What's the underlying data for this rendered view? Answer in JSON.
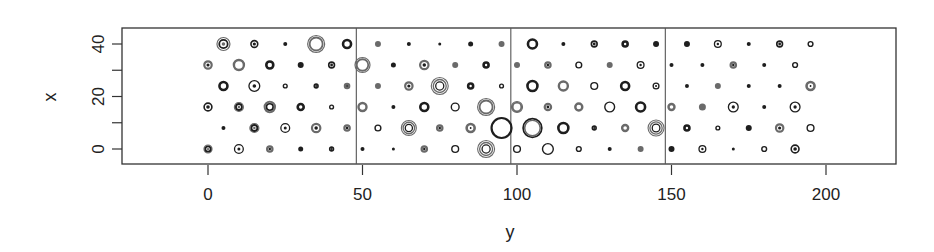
{
  "chart_data": {
    "type": "scatter",
    "title": "",
    "xlabel": "y",
    "ylabel": "x",
    "xlim": [
      -28,
      224
    ],
    "ylim": [
      -6,
      46
    ],
    "x_ticks": [
      0,
      50,
      100,
      150,
      200
    ],
    "x_tick_labels": [
      "0",
      "50",
      "100",
      "150",
      "200"
    ],
    "y_ticks": [
      0,
      10,
      20,
      30,
      40
    ],
    "y_tick_labels": [
      "0",
      "",
      "20",
      "",
      "40"
    ],
    "grid": false,
    "legend": null,
    "panel_dividers_at_y": [
      48,
      98,
      148
    ],
    "note": "Bubble/glyph scatter: points on a staggered grid; each marker is a set of concentric rings whose size varies. Values: [y, x, radius_px, style]",
    "points": [
      [
        5,
        40,
        7,
        "double"
      ],
      [
        15,
        40,
        4,
        "dot-ring"
      ],
      [
        25,
        40,
        2,
        "dot"
      ],
      [
        35,
        40,
        9,
        "double-thin"
      ],
      [
        45,
        40,
        5,
        "ring-thick"
      ],
      [
        55,
        40,
        3,
        "dot-grey"
      ],
      [
        65,
        40,
        2,
        "dot"
      ],
      [
        75,
        40,
        1.5,
        "dot"
      ],
      [
        85,
        40,
        2.5,
        "dot"
      ],
      [
        95,
        40,
        3,
        "dot-grey"
      ],
      [
        105,
        40,
        5.5,
        "ring-thick"
      ],
      [
        115,
        40,
        2,
        "dot"
      ],
      [
        125,
        40,
        3.5,
        "dot-ring"
      ],
      [
        135,
        40,
        3.5,
        "ring-thick"
      ],
      [
        145,
        40,
        3,
        "dot"
      ],
      [
        155,
        40,
        3,
        "dot"
      ],
      [
        165,
        40,
        4,
        "ring-dot"
      ],
      [
        175,
        40,
        2,
        "dot"
      ],
      [
        185,
        40,
        3.5,
        "dot-ring"
      ],
      [
        195,
        40,
        3,
        "ring"
      ],
      [
        0,
        32,
        4.5,
        "dot-ring-grey"
      ],
      [
        10,
        32,
        6,
        "ring-grey"
      ],
      [
        20,
        32,
        4.5,
        "ring-thick"
      ],
      [
        30,
        32,
        3,
        "dot"
      ],
      [
        40,
        32,
        3.5,
        "dot-ring"
      ],
      [
        50,
        32,
        8,
        "double-thin"
      ],
      [
        60,
        32,
        2.5,
        "dot"
      ],
      [
        70,
        32,
        5,
        "dot-ring-grey"
      ],
      [
        80,
        32,
        3,
        "dot-grey"
      ],
      [
        90,
        32,
        3.5,
        "ring-thick"
      ],
      [
        100,
        32,
        3,
        "dot-grey"
      ],
      [
        110,
        32,
        3.5,
        "dot-ring-grey"
      ],
      [
        120,
        32,
        3.5,
        "ring"
      ],
      [
        130,
        32,
        3,
        "dot-grey"
      ],
      [
        140,
        32,
        4,
        "ring-dot"
      ],
      [
        150,
        32,
        2,
        "dot"
      ],
      [
        160,
        32,
        2,
        "dot"
      ],
      [
        170,
        32,
        3.5,
        "dot-ring-grey"
      ],
      [
        180,
        32,
        2,
        "dot"
      ],
      [
        190,
        32,
        3,
        "ring"
      ],
      [
        5,
        24,
        5,
        "ring-thick"
      ],
      [
        15,
        24,
        6,
        "ring-dot"
      ],
      [
        25,
        24,
        2.5,
        "ring"
      ],
      [
        35,
        24,
        2.5,
        "dot-ring"
      ],
      [
        45,
        24,
        3,
        "dot-ring-grey"
      ],
      [
        55,
        24,
        3,
        "dot-grey"
      ],
      [
        65,
        24,
        4.5,
        "dot-ring-grey"
      ],
      [
        75,
        24,
        9,
        "triple"
      ],
      [
        85,
        24,
        3.5,
        "ring-thick"
      ],
      [
        95,
        24,
        2.5,
        "ring"
      ],
      [
        105,
        24,
        6,
        "ring-thick"
      ],
      [
        115,
        24,
        5.5,
        "ring-grey"
      ],
      [
        125,
        24,
        4,
        "ring"
      ],
      [
        135,
        24,
        5,
        "ring-thick"
      ],
      [
        145,
        24,
        3.5,
        "ring-dot"
      ],
      [
        155,
        24,
        2,
        "dot"
      ],
      [
        165,
        24,
        3,
        "dot-grey"
      ],
      [
        175,
        24,
        2,
        "dot"
      ],
      [
        185,
        24,
        2,
        "dot"
      ],
      [
        195,
        24,
        5,
        "ring-dot-grey"
      ],
      [
        0,
        16,
        4.5,
        "dot-ring"
      ],
      [
        10,
        16,
        5,
        "double"
      ],
      [
        20,
        16,
        6,
        "double-grey"
      ],
      [
        30,
        16,
        4,
        "ring-thick"
      ],
      [
        40,
        16,
        2.5,
        "ring"
      ],
      [
        50,
        16,
        5,
        "ring-grey"
      ],
      [
        60,
        16,
        2,
        "dot"
      ],
      [
        70,
        16,
        5,
        "ring-thick"
      ],
      [
        80,
        16,
        4.5,
        "ring"
      ],
      [
        90,
        16,
        9,
        "double-thin"
      ],
      [
        100,
        16,
        6,
        "double-thin"
      ],
      [
        110,
        16,
        4,
        "dot-ring-grey"
      ],
      [
        120,
        16,
        4.5,
        "ring-grey"
      ],
      [
        130,
        16,
        5.5,
        "ring"
      ],
      [
        140,
        16,
        5.5,
        "ring-thick"
      ],
      [
        150,
        16,
        4,
        "ring-grey"
      ],
      [
        160,
        16,
        3.5,
        "dot-grey"
      ],
      [
        170,
        16,
        5.5,
        "ring-dot"
      ],
      [
        180,
        16,
        2,
        "dot"
      ],
      [
        190,
        16,
        5.5,
        "ring-dot"
      ],
      [
        5,
        8,
        2,
        "dot"
      ],
      [
        15,
        8,
        5,
        "double"
      ],
      [
        25,
        8,
        5,
        "ring-dot"
      ],
      [
        35,
        8,
        5,
        "dot-ring-grey"
      ],
      [
        45,
        8,
        3.5,
        "dot-ring-grey"
      ],
      [
        55,
        8,
        3.5,
        "ring"
      ],
      [
        65,
        8,
        8,
        "triple"
      ],
      [
        75,
        8,
        3.5,
        "dot-ring-grey"
      ],
      [
        85,
        8,
        5,
        "ring-dot-grey"
      ],
      [
        95,
        8,
        11,
        "ring-thick-big"
      ],
      [
        105,
        8,
        10,
        "double-thick"
      ],
      [
        115,
        8,
        6,
        "ring-thick"
      ],
      [
        125,
        8,
        2.5,
        "dot-ring"
      ],
      [
        135,
        8,
        4,
        "ring-grey"
      ],
      [
        145,
        8,
        8.5,
        "triple"
      ],
      [
        155,
        8,
        3.5,
        "ring-thick"
      ],
      [
        165,
        8,
        2.5,
        "ring"
      ],
      [
        175,
        8,
        3,
        "dot"
      ],
      [
        185,
        8,
        4.5,
        "dot-ring-grey"
      ],
      [
        195,
        8,
        4,
        "ring"
      ],
      [
        0,
        0,
        4.5,
        "double"
      ],
      [
        10,
        0,
        5,
        "ring-dot"
      ],
      [
        20,
        0,
        3.5,
        "dot-ring-grey"
      ],
      [
        30,
        0,
        2.5,
        "dot"
      ],
      [
        40,
        0,
        2.5,
        "dot-ring"
      ],
      [
        50,
        0,
        2,
        "dot"
      ],
      [
        60,
        0,
        1.5,
        "dot"
      ],
      [
        70,
        0,
        3.5,
        "dot-ring-grey"
      ],
      [
        80,
        0,
        4,
        "ring"
      ],
      [
        90,
        0,
        9,
        "triple"
      ],
      [
        100,
        0,
        4,
        "ring"
      ],
      [
        110,
        0,
        6,
        "ring"
      ],
      [
        120,
        0,
        3,
        "ring"
      ],
      [
        130,
        0,
        2,
        "dot"
      ],
      [
        140,
        0,
        3,
        "dot-grey"
      ],
      [
        150,
        0,
        3,
        "dot"
      ],
      [
        160,
        0,
        4,
        "ring-dot"
      ],
      [
        170,
        0,
        1.5,
        "dot"
      ],
      [
        180,
        0,
        3,
        "ring"
      ],
      [
        190,
        0,
        4.5,
        "dot-ring"
      ]
    ]
  },
  "axes": {
    "xlabel": "y",
    "ylabel": "x"
  },
  "colors": {
    "ink": "#1e1e1e",
    "grey": "#6a6a6a",
    "frame": "#333333"
  }
}
